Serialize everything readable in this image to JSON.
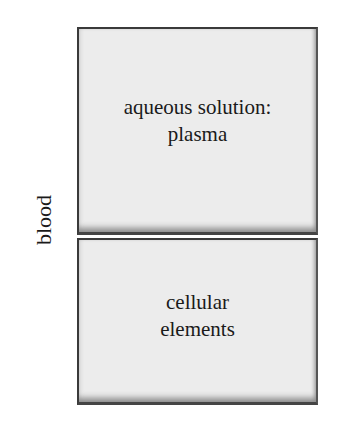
{
  "diagram": {
    "side_label": "blood",
    "compartments": [
      {
        "lines": [
          "aqueous solution:",
          "plasma"
        ]
      },
      {
        "lines": [
          "cellular",
          "elements"
        ]
      }
    ]
  }
}
